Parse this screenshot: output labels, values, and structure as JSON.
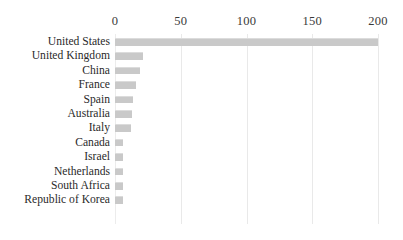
{
  "chart_data": {
    "type": "bar",
    "orientation": "horizontal",
    "title": "",
    "subtitle": "",
    "xlabel": "",
    "ylabel": "",
    "xlim": [
      0,
      200
    ],
    "grid": true,
    "legend": false,
    "legend_position": "none",
    "bar_color": "#c9c9c9",
    "gridline_color": "#e9e9e9",
    "text_color": "#2a2a2a",
    "xticks": [
      0,
      50,
      100,
      150,
      200
    ],
    "xtick_labels": [
      "0",
      "50",
      "100",
      "150",
      "200"
    ],
    "categories": [
      "United States",
      "United Kingdom",
      "China",
      "France",
      "Spain",
      "Australia",
      "Italy",
      "Canada",
      "Israel",
      "Netherlands",
      "South Africa",
      "Republic of Korea"
    ],
    "values": [
      200,
      21,
      19,
      16,
      14,
      13,
      12,
      6,
      6,
      6,
      6,
      6
    ]
  }
}
